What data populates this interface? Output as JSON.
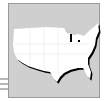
{
  "icon": {
    "subject": "united-states-map",
    "colors": {
      "background": "#cfcfcf",
      "border": "#9a9a9a",
      "land": "#ffffff",
      "shadow": "#000000",
      "lines": "#b8b8b8"
    },
    "decorative_lines": 3
  }
}
